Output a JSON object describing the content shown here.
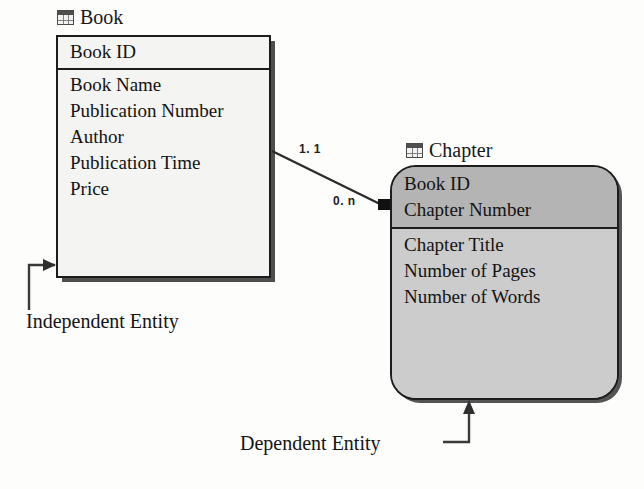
{
  "diagram": {
    "type": "entity-relationship-diagram",
    "notation": "IDEF1X",
    "entities": [
      {
        "id": "book",
        "name": "Book",
        "kind": "independent",
        "icon": "table-icon",
        "key_attributes": [
          "Book ID"
        ],
        "attributes": [
          "Book Name",
          "Publication Number",
          "Author",
          "Publication Time",
          "Price"
        ]
      },
      {
        "id": "chapter",
        "name": "Chapter",
        "kind": "dependent",
        "icon": "table-icon",
        "key_attributes": [
          "Book ID",
          "Chapter Number"
        ],
        "attributes": [
          "Chapter Title",
          "Number of Pages",
          "Number of Words"
        ]
      }
    ],
    "relationship": {
      "from": "book",
      "to": "chapter",
      "parent_cardinality": "1. 1",
      "child_cardinality": "0. n"
    },
    "annotations": [
      {
        "id": "independent",
        "label": "Independent Entity",
        "points_to": "book"
      },
      {
        "id": "dependent",
        "label": "Dependent Entity",
        "points_to": "chapter"
      }
    ],
    "colors": {
      "line": "#1c1c1c",
      "independent_fill": "#f4f4f2",
      "dependent_fill": "#c9c9c9",
      "dependent_key_fill": "#b4b4b4",
      "shadow": "#4e4e4e",
      "text": "#131313"
    }
  }
}
